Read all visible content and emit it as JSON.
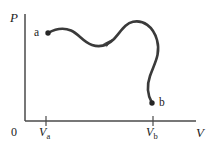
{
  "figure": {
    "kind": "pressure-volume-diagram",
    "background_color": "#ffffff",
    "ink_color": "#333333",
    "width": 214,
    "height": 148
  },
  "axes": {
    "y_axis_label": "P",
    "x_axis_label": "V",
    "origin_label": "0",
    "axis_color": "#4a4a4a",
    "x_axis": {
      "x_start": 25,
      "x_end": 196,
      "y": 121
    },
    "y_axis": {
      "x": 25,
      "y_start": 14,
      "y_end": 121
    }
  },
  "ticks": [
    {
      "name": "V-a",
      "label_main": "V",
      "label_sub": "a",
      "x": 46
    },
    {
      "name": "V-b",
      "label_main": "V",
      "label_sub": "b",
      "x": 153
    }
  ],
  "points": [
    {
      "name": "a",
      "label": "a",
      "x": 48,
      "y": 33,
      "label_side": "left"
    },
    {
      "name": "b",
      "label": "b",
      "x": 152,
      "y": 103,
      "label_side": "right"
    }
  ],
  "curve": {
    "name": "process-path-a-to-b",
    "stroke_color": "#3a3a3a",
    "stroke_width": 2.6,
    "path": "M 48 33 C 56 28.5, 64 27.5, 71 30.5 C 79 34, 83 42, 92 45 C 101 48, 108 45, 114 39 C 121 31.5, 125 23.5, 133 21.8 C 143 19.8, 153 26, 157 40 C 161 54, 154 64, 150 76 C 146.5 86, 148 96, 152 103"
  },
  "arrow": {
    "name": "direction-arrow",
    "x": 110,
    "y": 41,
    "angle_deg": -41,
    "description": "arrowhead along the curve pointing up and to the right, from a toward b"
  },
  "chart_data": {
    "type": "line",
    "title": "",
    "xlabel": "V",
    "ylabel": "P",
    "grid": false,
    "legend": null,
    "annotations": [
      "a",
      "b",
      "V_a",
      "V_b",
      "0",
      "direction arrow toward b"
    ],
    "series": [
      {
        "name": "process path a to b",
        "x": [
          48,
          58,
          71,
          82,
          92,
          103,
          114,
          124,
          133,
          145,
          157,
          155,
          150,
          147,
          152
        ],
        "y": [
          33,
          27.8,
          30.5,
          38.5,
          45,
          47.5,
          39,
          28,
          21.8,
          21.5,
          40,
          56,
          76,
          92,
          103
        ]
      }
    ],
    "markers": [
      {
        "label": "a",
        "x": 48,
        "y": 33
      },
      {
        "label": "b",
        "x": 152,
        "y": 103
      }
    ],
    "xticks": [
      {
        "label": "V_a",
        "x": 46
      },
      {
        "label": "V_b",
        "x": 153
      }
    ],
    "yticks": [],
    "note": "Coordinates are in screen pixels; axes are unlabeled/qualitative. P increases upward, V increases rightward."
  }
}
